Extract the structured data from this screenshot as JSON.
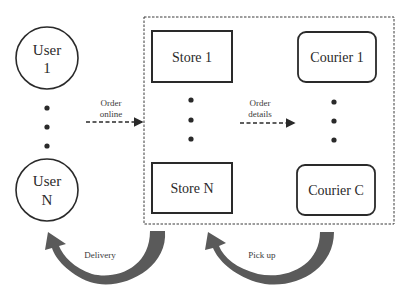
{
  "diagram": {
    "type": "flow",
    "colors": {
      "stroke": "#2a2a2a",
      "curved_arrow": "#5a5a5a",
      "background": "#ffffff"
    },
    "users": [
      {
        "line1": "User",
        "line2": "1"
      },
      {
        "line1": "User",
        "line2": "N"
      }
    ],
    "stores": [
      {
        "label": "Store 1"
      },
      {
        "label": "Store N"
      }
    ],
    "couriers": [
      {
        "label": "Courier 1"
      },
      {
        "label": "Courier C"
      }
    ],
    "edges": {
      "order_online": {
        "line1": "Order",
        "line2": "online"
      },
      "order_details": {
        "line1": "Order",
        "line2": "details"
      },
      "delivery": "Delivery",
      "pick_up": "Pick up"
    }
  }
}
